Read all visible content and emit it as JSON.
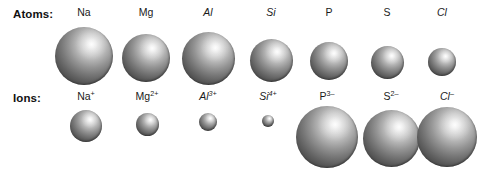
{
  "figure": {
    "width": 482,
    "height": 175,
    "background_color": "#ffffff",
    "sphere_highlight_color": "#fbfbfb",
    "sphere_edge_color": "#2e2e2e",
    "label_color": "#1a1a1a"
  },
  "rows": {
    "atoms": {
      "label": "Atoms:"
    },
    "ions": {
      "label": "Ions:"
    }
  },
  "chart_data": {
    "type": "scatter",
    "title": "",
    "subtitle": "",
    "xlabel": "",
    "ylabel": "",
    "legend_position": "none",
    "grid": false,
    "series": [
      {
        "name": "Atoms",
        "row_label": "Atoms:",
        "points": [
          {
            "label": "Na",
            "element": "Na",
            "charge": "",
            "italic": false,
            "cx": 84,
            "cy": 56,
            "diameter": 58
          },
          {
            "label": "Mg",
            "element": "Mg",
            "charge": "",
            "italic": false,
            "cx": 146,
            "cy": 58,
            "diameter": 48
          },
          {
            "label": "Al",
            "element": "Al",
            "charge": "",
            "italic": true,
            "cx": 208,
            "cy": 58,
            "diameter": 53
          },
          {
            "label": "Si",
            "element": "Si",
            "charge": "",
            "italic": true,
            "cx": 271,
            "cy": 60,
            "diameter": 43
          },
          {
            "label": "P",
            "element": "P",
            "charge": "",
            "italic": false,
            "cx": 329,
            "cy": 61,
            "diameter": 38
          },
          {
            "label": "S",
            "element": "S",
            "charge": "",
            "italic": false,
            "cx": 387,
            "cy": 62,
            "diameter": 33
          },
          {
            "label": "Cl",
            "element": "Cl",
            "charge": "",
            "italic": true,
            "cx": 442,
            "cy": 62,
            "diameter": 28
          }
        ]
      },
      {
        "name": "Ions",
        "row_label": "Ions:",
        "points": [
          {
            "label": "Na+",
            "element": "Na",
            "charge": "+",
            "italic": false,
            "cx": 86,
            "cy": 126,
            "diameter": 32
          },
          {
            "label": "Mg2+",
            "element": "Mg",
            "charge": "2+",
            "italic": false,
            "cx": 147,
            "cy": 124,
            "diameter": 23
          },
          {
            "label": "Al3+",
            "element": "Al",
            "charge": "3+",
            "italic": true,
            "cx": 208,
            "cy": 122,
            "diameter": 18
          },
          {
            "label": "Si4+",
            "element": "Si",
            "charge": "4+",
            "italic": true,
            "cx": 268,
            "cy": 121,
            "diameter": 12
          },
          {
            "label": "P3-",
            "element": "P",
            "charge": "3–",
            "italic": false,
            "cx": 327,
            "cy": 137,
            "diameter": 62
          },
          {
            "label": "S2-",
            "element": "S",
            "charge": "2–",
            "italic": false,
            "cx": 391,
            "cy": 138,
            "diameter": 57
          },
          {
            "label": "Cl-",
            "element": "Cl",
            "charge": "–",
            "italic": true,
            "cx": 447,
            "cy": 137,
            "diameter": 60
          }
        ]
      }
    ],
    "label_positions": {
      "atoms_label_y": 7,
      "ions_label_y": 91
    }
  }
}
